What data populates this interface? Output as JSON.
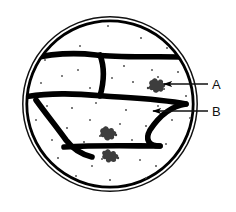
{
  "figure": {
    "type": "biology-line-diagram",
    "background_color": "#ffffff",
    "ink_color": "#000000"
  },
  "dish": {
    "name": "petri-dish",
    "center_x": 110,
    "center_y": 104,
    "outer_radius": 88,
    "inner_radius": 84,
    "outline_style": "double-ring",
    "outer_stroke_width": 1.4,
    "inner_stroke_width": 2.6
  },
  "walls": {
    "name": "dark-dividing-lines",
    "stroke_color": "#000000",
    "stroke_width": 5.5,
    "count": 6,
    "paths": [
      "M 31 58 C 50 54, 72 53, 96 55 C 120 57, 150 56, 184 57",
      "M 100 56 C 104 68, 103 80, 100 96",
      "M 24 96 C 52 94, 78 95, 104 96 C 132 97, 162 99, 184 104",
      "M 36 99 C 48 112, 58 124, 68 140 C 78 152, 86 158, 98 159",
      "M 68 148 C 100 147, 134 147, 158 146",
      "M 184 104 C 172 108, 160 118, 152 130 C 146 140, 140 146, 158 146"
    ]
  },
  "speckles": {
    "name": "agar-speckles",
    "color": "#555555",
    "count": 42,
    "radius": 1.1
  },
  "colonies": {
    "name": "bacterial-colony-clusters",
    "color": "#3a3a3a",
    "count": 4,
    "items": [
      {
        "x": 157,
        "y": 85,
        "label_ref": "A"
      },
      {
        "x": 108,
        "y": 133,
        "label_ref": null
      },
      {
        "x": 110,
        "y": 155,
        "label_ref": null
      },
      {
        "x": 160,
        "y": 88,
        "label_ref": null
      }
    ]
  },
  "callouts": [
    {
      "id": "callout-a",
      "label": "A",
      "points_to": "bacterial-colony-cluster",
      "label_x": 212,
      "label_y": 78,
      "leader_start_x": 208,
      "leader_start_y": 84,
      "leader_end_x": 163,
      "leader_end_y": 84,
      "arrowhead": "left"
    },
    {
      "id": "callout-b",
      "label": "B",
      "points_to": "dark-dividing-line",
      "label_x": 212,
      "label_y": 105,
      "leader_start_x": 208,
      "leader_start_y": 111,
      "leader_end_x": 152,
      "leader_end_y": 111,
      "arrowhead": "left"
    }
  ]
}
